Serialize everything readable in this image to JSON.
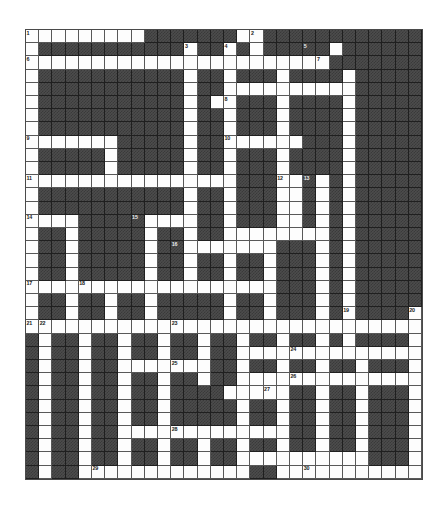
{
  "puzzle": {
    "title": "Crossword Grid",
    "type": "crossword",
    "columns": 30,
    "rows": 34,
    "cell_size_px": 13.2,
    "origin_px": {
      "x": 25,
      "y": 29
    },
    "colors": {
      "open_cell": "#fdfdfd",
      "block_cell": "#4c4c4c",
      "grid_line": "#585858",
      "border": "#4a4a4a",
      "number_text": "#1a1a1a",
      "page_background": "#ffffff"
    },
    "clue_count": 30,
    "numbers": [
      {
        "n": 1,
        "row": 0,
        "col": 0
      },
      {
        "n": 2,
        "row": 0,
        "col": 17
      },
      {
        "n": 3,
        "row": 1,
        "col": 12
      },
      {
        "n": 4,
        "row": 1,
        "col": 15
      },
      {
        "n": 5,
        "row": 1,
        "col": 21
      },
      {
        "n": 6,
        "row": 2,
        "col": 0
      },
      {
        "n": 7,
        "row": 2,
        "col": 22
      },
      {
        "n": 8,
        "row": 5,
        "col": 15
      },
      {
        "n": 9,
        "row": 8,
        "col": 0
      },
      {
        "n": 10,
        "row": 8,
        "col": 15
      },
      {
        "n": 11,
        "row": 11,
        "col": 0
      },
      {
        "n": 12,
        "row": 11,
        "col": 19
      },
      {
        "n": 13,
        "row": 11,
        "col": 21
      },
      {
        "n": 14,
        "row": 14,
        "col": 0
      },
      {
        "n": 15,
        "row": 14,
        "col": 8
      },
      {
        "n": 16,
        "row": 16,
        "col": 11
      },
      {
        "n": 17,
        "row": 19,
        "col": 0
      },
      {
        "n": 18,
        "row": 19,
        "col": 4
      },
      {
        "n": 19,
        "row": 21,
        "col": 24
      },
      {
        "n": 20,
        "row": 21,
        "col": 29
      },
      {
        "n": 21,
        "row": 22,
        "col": 0
      },
      {
        "n": 22,
        "row": 22,
        "col": 1
      },
      {
        "n": 23,
        "row": 22,
        "col": 11
      },
      {
        "n": 24,
        "row": 24,
        "col": 20
      },
      {
        "n": 25,
        "row": 25,
        "col": 11
      },
      {
        "n": 26,
        "row": 26,
        "col": 20
      },
      {
        "n": 27,
        "row": 27,
        "col": 18
      },
      {
        "n": 28,
        "row": 30,
        "col": 11
      },
      {
        "n": 29,
        "row": 33,
        "col": 5
      },
      {
        "n": 30,
        "row": 33,
        "col": 21
      }
    ],
    "open_rows": [
      "111111111000000011000000000000",
      "100000000000100101000001000000",
      "111111111111111111111110000000",
      "100000000000100100010000100000",
      "100000000000100111111111100000",
      "100000000000101100010000100000",
      "100000000000100100010000100000",
      "100000000000100100010000100000",
      "111111100000100111111000100000",
      "100000100000100100010000100000",
      "100000100000100100010000100000",
      "111111111111111100011010100000",
      "100000000000100100011010100000",
      "100000000000100100011010100000",
      "111100000111100100011010100000",
      "100100000100100111111110100000",
      "100100000100111111100010100000",
      "100100000100100100100010100000",
      "100100000100100100100010100000",
      "111111111111111111100010100000",
      "100100100100000100100010100000",
      "100100100100000100100010100001",
      "111111111111111111111111111111",
      "010010010010010010010010100001",
      "010010010010010011111111111111",
      "010010011111110010010010010001",
      "010010010010010011111111111111",
      "010010010010000111110010010001",
      "010010010010000010010010010001",
      "010010010010000010010010010001",
      "010010011111111111110010010001",
      "010010010010010010010010010001",
      "010010010010010011111111110001",
      "010011111111111110011111111111"
    ]
  }
}
